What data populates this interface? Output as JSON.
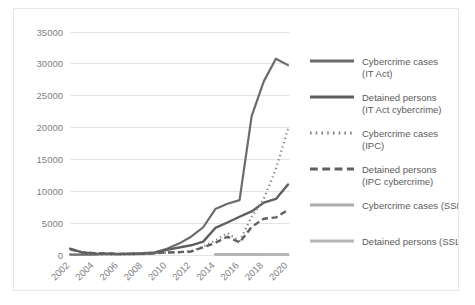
{
  "chart_data": {
    "type": "line",
    "title": "",
    "xlabel": "",
    "ylabel": "",
    "ylim": [
      0,
      35000
    ],
    "ytick_values": [
      0,
      5000,
      10000,
      15000,
      20000,
      25000,
      30000,
      35000
    ],
    "ytick_labels": [
      "0",
      "5000",
      "10000",
      "15000",
      "20000",
      "25000",
      "30000",
      "35000"
    ],
    "grid": true,
    "legend_position": "right",
    "x": [
      2002,
      2003,
      2004,
      2005,
      2006,
      2007,
      2008,
      2009,
      2010,
      2011,
      2012,
      2013,
      2014,
      2015,
      2016,
      2017,
      2018,
      2019,
      2020
    ],
    "xtick_labels": [
      "2002",
      "2004",
      "2006",
      "2008",
      "2010",
      "2012",
      "2014",
      "2016",
      "2018",
      "2020"
    ],
    "xtick_values": [
      2002,
      2004,
      2006,
      2008,
      2010,
      2012,
      2014,
      2016,
      2018,
      2020
    ],
    "series": [
      {
        "name": "Cybercrime cases (IT Act)",
        "label_line1": "Cybercrime cases",
        "label_line2": "(IT Act)",
        "style": "solid",
        "color": "#6b6b6b",
        "width": 2.2,
        "values": [
          70,
          60,
          68,
          179,
          142,
          217,
          288,
          420,
          966,
          1791,
          2876,
          4356,
          7201,
          8045,
          8613,
          21796,
          27248,
          30800,
          29800
        ]
      },
      {
        "name": "Detained persons (IT Act cybercrime)",
        "label_line1": "Detained persons",
        "label_line2": "(IT Act cybercrime)",
        "style": "solid",
        "color": "#5e5e5e",
        "width": 2.4,
        "values": [
          1000,
          400,
          250,
          200,
          150,
          160,
          178,
          288,
          799,
          1184,
          1522,
          2098,
          4246,
          5102,
          6000,
          6835,
          8218,
          8795,
          11073
        ]
      },
      {
        "name": "Cybercrime cases (IPC)",
        "label_line1": "Cybercrime cases",
        "label_line2": "(IPC)",
        "style": "dotted",
        "color": "#7d7d7d",
        "width": 2.2,
        "values": [
          100,
          90,
          80,
          70,
          60,
          90,
          130,
          276,
          356,
          422,
          601,
          1337,
          2272,
          3422,
          2203,
          6000,
          8820,
          13500,
          19800
        ]
      },
      {
        "name": "Detained persons (IPC cybercrime)",
        "label_line1": "Detained persons",
        "label_line2": "(IPC cybercrime)",
        "style": "dashed",
        "color": "#606060",
        "width": 2.4,
        "values": [
          900,
          420,
          300,
          240,
          180,
          180,
          200,
          263,
          394,
          446,
          549,
          1203,
          1897,
          2867,
          1963,
          4400,
          5700,
          5900,
          7100
        ]
      },
      {
        "name": "Cybercrime cases (SSL)",
        "label_line1": "Cybercrime cases (SSL)",
        "label_line2": "",
        "style": "solid",
        "color": "#adadad",
        "width": 2.6,
        "start_index": 12,
        "values": [
          null,
          null,
          null,
          null,
          null,
          null,
          null,
          null,
          null,
          null,
          null,
          null,
          120,
          110,
          100,
          100,
          90,
          90,
          80
        ]
      },
      {
        "name": "Detained persons (SSL)",
        "label_line1": "Detained persons (SSL)",
        "label_line2": "",
        "style": "solid",
        "color": "#b5b5b5",
        "width": 2.6,
        "start_index": 12,
        "values": [
          null,
          null,
          null,
          null,
          null,
          null,
          null,
          null,
          null,
          null,
          null,
          null,
          60,
          55,
          50,
          50,
          45,
          45,
          40
        ]
      }
    ]
  },
  "legend": {
    "items": [
      {
        "label_line1": "Cybercrime cases",
        "label_line2": "(IT Act)"
      },
      {
        "label_line1": "Detained persons",
        "label_line2": "(IT Act cybercrime)"
      },
      {
        "label_line1": "Cybercrime cases",
        "label_line2": "(IPC)"
      },
      {
        "label_line1": "Detained persons",
        "label_line2": "(IPC cybercrime)"
      },
      {
        "label_line1": "Cybercrime cases (SSL)",
        "label_line2": ""
      },
      {
        "label_line1": "Detained persons (SSL)",
        "label_line2": ""
      }
    ]
  }
}
